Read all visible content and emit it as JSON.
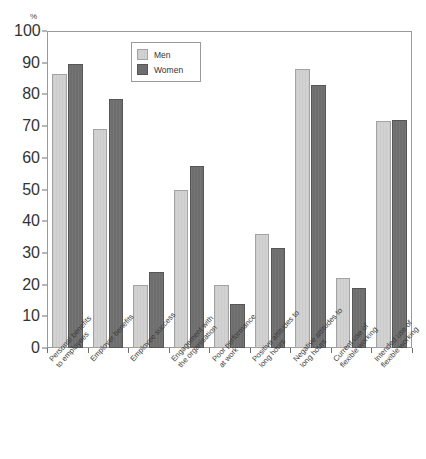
{
  "chart_data": {
    "type": "bar",
    "title": "",
    "subtitle": "",
    "xlabel": "",
    "ylabel": "%",
    "unit_label": "%",
    "ylim": [
      0,
      100
    ],
    "ytick_values": [
      0,
      10,
      20,
      30,
      40,
      50,
      60,
      70,
      80,
      90,
      100
    ],
    "ytick_labels": [
      "0",
      "10",
      "20",
      "30",
      "40",
      "50",
      "60",
      "70",
      "80",
      "90",
      "100"
    ],
    "grid": false,
    "legend_position": "top-center",
    "categories": [
      "Personal benefits to employees",
      "Employer benefits",
      "Employee success",
      "Engagement with the organisation",
      "Poor performance at work",
      "Positive attitudes to long hours",
      "Negative attitudes to long hours",
      "Current use of flexible working",
      "Intended use of flexible working"
    ],
    "category_lines": [
      [
        "Personal benefits",
        "to employees"
      ],
      [
        "Employer benefits"
      ],
      [
        "Employee success"
      ],
      [
        "Engagement with",
        "the organisation"
      ],
      [
        "Poor performance",
        "at work"
      ],
      [
        "Positive attitudes to",
        "long hours"
      ],
      [
        "Negative attitudes to",
        "long hours"
      ],
      [
        "Current use of",
        "flexible working"
      ],
      [
        "Intended use of",
        "flexible working"
      ]
    ],
    "series": [
      {
        "name": "Men",
        "color": "#d2d2d2",
        "values": [
          86.5,
          69.0,
          20.0,
          50.0,
          20.0,
          36.0,
          88.0,
          22.0,
          71.5
        ]
      },
      {
        "name": "Women",
        "color": "#6e6e6e",
        "values": [
          89.5,
          78.5,
          24.0,
          57.5,
          14.0,
          31.5,
          83.0,
          19.0,
          72.0
        ]
      }
    ]
  },
  "legend": {
    "items": [
      {
        "label": "Men",
        "swatch": "men"
      },
      {
        "label": "Women",
        "swatch": "women"
      }
    ]
  },
  "colors": {
    "men_fill": "#d2d2d2",
    "women_fill": "#6e6e6e",
    "axis": "#9a9a9a",
    "text": "#333333",
    "background": "#ffffff"
  }
}
